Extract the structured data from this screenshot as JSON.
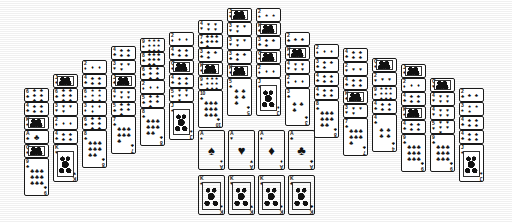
{
  "app": {
    "title": "Solitaire Tableau",
    "background_color": "#ffffff",
    "card_face_color": "#ffffff",
    "card_border_color": "#1a1a1a",
    "ink_color": "#111111"
  },
  "layout": {
    "columns": 16,
    "column_start_x": 24,
    "column_step_x": 29,
    "card_width": 25,
    "card_height": 38,
    "fan_offset_y": 14,
    "shape": "pyramid"
  },
  "suits": {
    "spade": "♠",
    "heart": "♥",
    "diamond": "♦",
    "club": "♣"
  },
  "tableau": {
    "label": "tableau",
    "piles": [
      {
        "x": 24,
        "top": 88,
        "cards": [
          {
            "rank": "6",
            "suit": "club",
            "facing": "up",
            "covered": true
          },
          {
            "rank": "4",
            "suit": "club",
            "facing": "up",
            "covered": true
          },
          {
            "rank": "K",
            "suit": "spade",
            "facing": "up",
            "covered": true
          },
          {
            "rank": "A",
            "suit": "club",
            "facing": "up",
            "covered": true
          },
          {
            "rank": "Q",
            "suit": "diamond",
            "facing": "up",
            "covered": true
          },
          {
            "rank": "9",
            "suit": "club",
            "facing": "up",
            "covered": false
          }
        ]
      },
      {
        "x": 53,
        "top": 74,
        "cards": [
          {
            "rank": "J",
            "suit": "diamond",
            "facing": "up",
            "covered": true
          },
          {
            "rank": "6",
            "suit": "club",
            "facing": "up",
            "covered": true
          },
          {
            "rank": "3",
            "suit": "heart",
            "facing": "up",
            "covered": true
          },
          {
            "rank": "2",
            "suit": "diamond",
            "facing": "up",
            "covered": true
          },
          {
            "rank": "4",
            "suit": "club",
            "facing": "up",
            "covered": true
          },
          {
            "rank": "K",
            "suit": "heart",
            "facing": "up",
            "covered": false
          }
        ]
      },
      {
        "x": 82,
        "top": 60,
        "cards": [
          {
            "rank": "2",
            "suit": "diamond",
            "facing": "up",
            "covered": true
          },
          {
            "rank": "4",
            "suit": "club",
            "facing": "up",
            "covered": true
          },
          {
            "rank": "6",
            "suit": "spade",
            "facing": "up",
            "covered": true
          },
          {
            "rank": "3",
            "suit": "diamond",
            "facing": "up",
            "covered": true
          },
          {
            "rank": "6",
            "suit": "club",
            "facing": "up",
            "covered": true
          },
          {
            "rank": "8",
            "suit": "club",
            "facing": "up",
            "covered": false
          }
        ]
      },
      {
        "x": 111,
        "top": 46,
        "cards": [
          {
            "rank": "4",
            "suit": "club",
            "facing": "up",
            "covered": true
          },
          {
            "rank": "3",
            "suit": "heart",
            "facing": "up",
            "covered": true
          },
          {
            "rank": "J",
            "suit": "club",
            "facing": "up",
            "covered": true
          },
          {
            "rank": "4",
            "suit": "heart",
            "facing": "up",
            "covered": true
          },
          {
            "rank": "5",
            "suit": "club",
            "facing": "up",
            "covered": true
          },
          {
            "rank": "7",
            "suit": "club",
            "facing": "up",
            "covered": false
          }
        ]
      },
      {
        "x": 140,
        "top": 38,
        "cards": [
          {
            "rank": "9",
            "suit": "spade",
            "facing": "up",
            "covered": true
          },
          {
            "rank": "8",
            "suit": "club",
            "facing": "up",
            "covered": true
          },
          {
            "rank": "6",
            "suit": "club",
            "facing": "up",
            "covered": true
          },
          {
            "rank": "2",
            "suit": "diamond",
            "facing": "up",
            "covered": true
          },
          {
            "rank": "5",
            "suit": "club",
            "facing": "up",
            "covered": true
          },
          {
            "rank": "8",
            "suit": "club",
            "facing": "up",
            "covered": false
          }
        ]
      },
      {
        "x": 169,
        "top": 32,
        "cards": [
          {
            "rank": "2",
            "suit": "diamond",
            "facing": "up",
            "covered": true
          },
          {
            "rank": "4",
            "suit": "club",
            "facing": "up",
            "covered": true
          },
          {
            "rank": "Q",
            "suit": "diamond",
            "facing": "up",
            "covered": true
          },
          {
            "rank": "4",
            "suit": "club",
            "facing": "up",
            "covered": true
          },
          {
            "rank": "5",
            "suit": "heart",
            "facing": "up",
            "covered": true
          },
          {
            "rank": "J",
            "suit": "spade",
            "facing": "up",
            "covered": false
          }
        ]
      },
      {
        "x": 198,
        "top": 20,
        "cards": [
          {
            "rank": "4",
            "suit": "heart",
            "facing": "up",
            "covered": true
          },
          {
            "rank": "7",
            "suit": "club",
            "facing": "up",
            "covered": true
          },
          {
            "rank": "3",
            "suit": "club",
            "facing": "up",
            "covered": true
          },
          {
            "rank": "K",
            "suit": "diamond",
            "facing": "up",
            "covered": true
          },
          {
            "rank": "9",
            "suit": "spade",
            "facing": "up",
            "covered": true
          },
          {
            "rank": "10",
            "suit": "club",
            "facing": "up",
            "covered": false
          }
        ]
      },
      {
        "x": 227,
        "top": 8,
        "cards": [
          {
            "rank": "J",
            "suit": "heart",
            "facing": "up",
            "covered": true
          },
          {
            "rank": "3",
            "suit": "heart",
            "facing": "up",
            "covered": true
          },
          {
            "rank": "3",
            "suit": "heart",
            "facing": "up",
            "covered": true
          },
          {
            "rank": "3",
            "suit": "club",
            "facing": "up",
            "covered": true
          },
          {
            "rank": "K",
            "suit": "diamond",
            "facing": "up",
            "covered": true
          },
          {
            "rank": "5",
            "suit": "club",
            "facing": "up",
            "covered": false
          }
        ]
      },
      {
        "x": 256,
        "top": 8,
        "cards": [
          {
            "rank": "2",
            "suit": "spade",
            "facing": "up",
            "covered": true
          },
          {
            "rank": "K",
            "suit": "club",
            "facing": "up",
            "covered": true
          },
          {
            "rank": "3",
            "suit": "club",
            "facing": "up",
            "covered": true
          },
          {
            "rank": "Q",
            "suit": "spade",
            "facing": "up",
            "covered": true
          },
          {
            "rank": "2",
            "suit": "diamond",
            "facing": "up",
            "covered": true
          },
          {
            "rank": "J",
            "suit": "diamond",
            "facing": "up",
            "covered": false
          }
        ]
      },
      {
        "x": 285,
        "top": 32,
        "cards": [
          {
            "rank": "2",
            "suit": "club",
            "facing": "up",
            "covered": true
          },
          {
            "rank": "K",
            "suit": "spade",
            "facing": "up",
            "covered": true
          },
          {
            "rank": "4",
            "suit": "heart",
            "facing": "up",
            "covered": true
          },
          {
            "rank": "2",
            "suit": "diamond",
            "facing": "up",
            "covered": true
          },
          {
            "rank": "3",
            "suit": "club",
            "facing": "up",
            "covered": false
          }
        ]
      },
      {
        "x": 314,
        "top": 44,
        "cards": [
          {
            "rank": "2",
            "suit": "diamond",
            "facing": "up",
            "covered": true
          },
          {
            "rank": "3",
            "suit": "club",
            "facing": "up",
            "covered": true
          },
          {
            "rank": "4",
            "suit": "club",
            "facing": "up",
            "covered": true
          },
          {
            "rank": "4",
            "suit": "club",
            "facing": "up",
            "covered": true
          },
          {
            "rank": "8",
            "suit": "club",
            "facing": "up",
            "covered": false
          }
        ]
      },
      {
        "x": 343,
        "top": 48,
        "cards": [
          {
            "rank": "4",
            "suit": "club",
            "facing": "up",
            "covered": true
          },
          {
            "rank": "2",
            "suit": "heart",
            "facing": "up",
            "covered": true
          },
          {
            "rank": "4",
            "suit": "club",
            "facing": "up",
            "covered": true
          },
          {
            "rank": "K",
            "suit": "club",
            "facing": "up",
            "covered": true
          },
          {
            "rank": "3",
            "suit": "heart",
            "facing": "up",
            "covered": true
          },
          {
            "rank": "7",
            "suit": "club",
            "facing": "up",
            "covered": false
          }
        ]
      },
      {
        "x": 372,
        "top": 58,
        "cards": [
          {
            "rank": "Q",
            "suit": "diamond",
            "facing": "up",
            "covered": true
          },
          {
            "rank": "2",
            "suit": "heart",
            "facing": "up",
            "covered": true
          },
          {
            "rank": "9",
            "suit": "spade",
            "facing": "up",
            "covered": true
          },
          {
            "rank": "4",
            "suit": "club",
            "facing": "up",
            "covered": true
          },
          {
            "rank": "4",
            "suit": "club",
            "facing": "up",
            "covered": false
          }
        ]
      },
      {
        "x": 401,
        "top": 64,
        "cards": [
          {
            "rank": "J",
            "suit": "diamond",
            "facing": "up",
            "covered": true
          },
          {
            "rank": "2",
            "suit": "diamond",
            "facing": "up",
            "covered": true
          },
          {
            "rank": "4",
            "suit": "club",
            "facing": "up",
            "covered": true
          },
          {
            "rank": "K",
            "suit": "spade",
            "facing": "up",
            "covered": true
          },
          {
            "rank": "4",
            "suit": "club",
            "facing": "up",
            "covered": true
          },
          {
            "rank": "9",
            "suit": "club",
            "facing": "up",
            "covered": false
          }
        ]
      },
      {
        "x": 430,
        "top": 78,
        "cards": [
          {
            "rank": "Q",
            "suit": "heart",
            "facing": "up",
            "covered": true
          },
          {
            "rank": "4",
            "suit": "heart",
            "facing": "up",
            "covered": true
          },
          {
            "rank": "4",
            "suit": "heart",
            "facing": "up",
            "covered": true
          },
          {
            "rank": "5",
            "suit": "heart",
            "facing": "up",
            "covered": true
          },
          {
            "rank": "9",
            "suit": "club",
            "facing": "up",
            "covered": false
          }
        ]
      },
      {
        "x": 459,
        "top": 88,
        "cards": [
          {
            "rank": "2",
            "suit": "club",
            "facing": "up",
            "covered": true
          },
          {
            "rank": "3",
            "suit": "spade",
            "facing": "up",
            "covered": true
          },
          {
            "rank": "4",
            "suit": "club",
            "facing": "up",
            "covered": true
          },
          {
            "rank": "4",
            "suit": "club",
            "facing": "up",
            "covered": true
          },
          {
            "rank": "J",
            "suit": "spade",
            "facing": "up",
            "covered": false
          }
        ]
      }
    ]
  },
  "foundations": {
    "label": "foundations",
    "x": 198,
    "y": 130,
    "step_x": 30,
    "cards": [
      {
        "rank": "A",
        "suit": "spade"
      },
      {
        "rank": "A",
        "suit": "heart"
      },
      {
        "rank": "A",
        "suit": "diamond"
      },
      {
        "rank": "A",
        "suit": "club"
      }
    ]
  },
  "reserve": {
    "label": "reserve-kings",
    "x": 198,
    "y": 175,
    "step_x": 30,
    "cards": [
      {
        "rank": "K",
        "suit": "spade"
      },
      {
        "rank": "K",
        "suit": "heart"
      },
      {
        "rank": "K",
        "suit": "diamond"
      },
      {
        "rank": "K",
        "suit": "club"
      }
    ]
  }
}
